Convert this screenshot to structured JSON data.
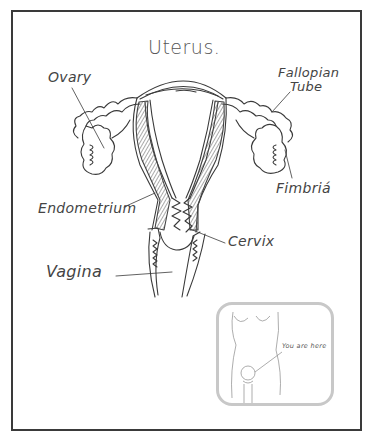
{
  "diagram": {
    "title": "Uterus.",
    "labels": {
      "ovary": "Ovary",
      "fallopian_line1": "Fallopian",
      "fallopian_line2": "Tube",
      "fimbria": "Fimbriá",
      "endometrium": "Endometrium",
      "cervix": "Cervix",
      "vagina": "Vagina"
    },
    "inset": {
      "caption": "You are here"
    },
    "colors": {
      "stroke": "#3a3a3a",
      "frame": "#3a3a3a",
      "inset_border": "#c8c8c8"
    }
  }
}
